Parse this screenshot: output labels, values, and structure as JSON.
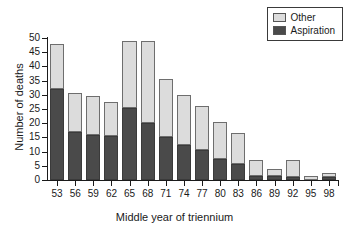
{
  "chart_data": {
    "type": "bar",
    "stacked": true,
    "title": "",
    "xlabel": "Middle year of triennium",
    "ylabel": "Number of deaths",
    "categories": [
      "53",
      "56",
      "59",
      "62",
      "65",
      "68",
      "71",
      "74",
      "77",
      "80",
      "83",
      "86",
      "89",
      "92",
      "95",
      "98"
    ],
    "ylim": [
      0,
      50
    ],
    "ytick_step": 5,
    "yticks": [
      "50",
      "45",
      "40",
      "35",
      "30",
      "25",
      "20",
      "15",
      "10",
      "5",
      "0"
    ],
    "grid": false,
    "legend_position": "top-right",
    "series": [
      {
        "name": "Aspiration",
        "color": "#4a4a4a",
        "values": [
          32,
          17,
          16,
          15.5,
          25.5,
          20,
          15,
          12.5,
          10.5,
          7.5,
          5.5,
          1.5,
          1.5,
          1,
          0,
          1
        ]
      },
      {
        "name": "Other",
        "color": "#dcdcdc",
        "values": [
          16,
          13.5,
          13.5,
          12,
          23.5,
          29,
          20.5,
          17.5,
          15.5,
          13,
          11,
          5.5,
          2.5,
          6,
          1.5,
          1.5
        ]
      }
    ],
    "totals": [
      48,
      30.5,
      29.5,
      27.5,
      49,
      49,
      35.5,
      30,
      26,
      20.5,
      16.5,
      7,
      4,
      7,
      1.5,
      2.5
    ]
  },
  "legend": {
    "entries": [
      {
        "label": "Other",
        "swatch": "#dcdcdc"
      },
      {
        "label": "Aspiration",
        "swatch": "#4a4a4a"
      }
    ]
  }
}
